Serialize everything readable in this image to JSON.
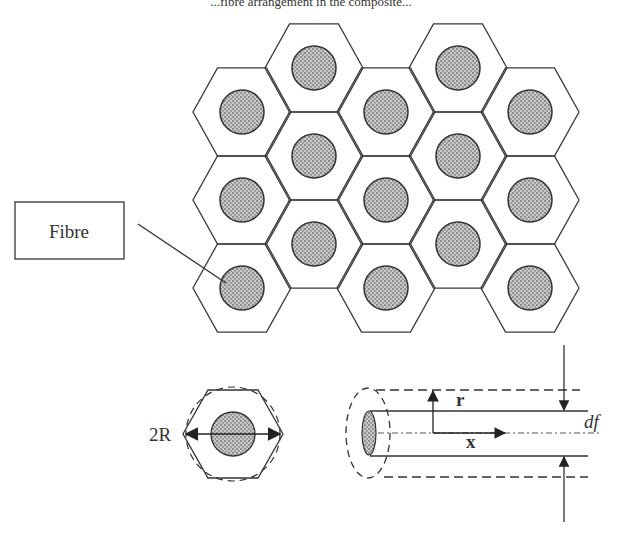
{
  "header": {
    "caption_fragment": "...fibre arrangement in the composite..."
  },
  "diagram": {
    "stroke_color": "#3a3a3a",
    "fibre_fill": "#9a9a9a",
    "hex_grid": {
      "columns": 5,
      "rows_per_column": 3,
      "hex_circumradius": 49,
      "fibre_radius": 22,
      "column_centers_x": [
        242,
        314,
        386,
        458,
        530
      ],
      "odd_column_centers_y": [
        112,
        200,
        288
      ],
      "even_column_centers_y": [
        68,
        156,
        244
      ]
    },
    "labels": {
      "fibre": "Fibre",
      "diameter_label": "2R",
      "radial_axis": "r",
      "axial_axis": "x",
      "fibre_diameter": "df"
    }
  }
}
